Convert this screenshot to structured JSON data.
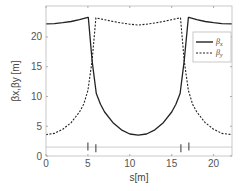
{
  "chart_data": {
    "type": "line",
    "title": "",
    "xlabel": "s[m]",
    "ylabel": "βx,βy [m]",
    "xlim": [
      0,
      22.2
    ],
    "ylim": [
      0,
      25.2
    ],
    "xticks": [
      0,
      5,
      10,
      15,
      20
    ],
    "yticks": [
      0,
      5,
      10,
      15,
      20
    ],
    "grid": false,
    "legend_position": "upper right",
    "series": [
      {
        "name": "βx",
        "style": "solid",
        "color": "#222222",
        "x": [
          0,
          1,
          2,
          3,
          4,
          5,
          5.05,
          5.5,
          6,
          6.5,
          7,
          8,
          9,
          10,
          11,
          12,
          13,
          14,
          15,
          15.5,
          16,
          16.5,
          17.0,
          17.05,
          18,
          19,
          20,
          21,
          22.2
        ],
        "y": [
          22.2,
          22.25,
          22.4,
          22.6,
          22.9,
          23.3,
          23.3,
          16.0,
          10.5,
          8.7,
          7.4,
          5.6,
          4.4,
          3.7,
          3.5,
          3.7,
          4.4,
          5.6,
          7.4,
          8.7,
          10.5,
          16.0,
          23.3,
          23.3,
          22.9,
          22.6,
          22.4,
          22.25,
          22.2
        ]
      },
      {
        "name": "βy",
        "style": "dashed",
        "color": "#222222",
        "x": [
          0,
          1,
          2,
          3,
          4,
          4.5,
          5,
          5.5,
          5.95,
          6,
          7,
          8,
          9,
          10,
          11,
          12,
          13,
          14,
          15,
          16,
          16.05,
          16.5,
          17,
          17.5,
          18,
          19,
          20,
          21,
          22.2
        ],
        "y": [
          3.6,
          3.8,
          4.5,
          5.6,
          7.4,
          8.7,
          11.0,
          16.0,
          23.2,
          23.2,
          22.9,
          22.6,
          22.35,
          22.15,
          22.0,
          22.15,
          22.35,
          22.6,
          22.9,
          23.2,
          23.2,
          16.0,
          11.0,
          8.7,
          7.4,
          5.6,
          4.5,
          3.8,
          3.6
        ]
      }
    ],
    "annotations": [
      {
        "type": "element-marker",
        "s": 5.0,
        "y": 1.6
      },
      {
        "type": "element-marker",
        "s": 5.95,
        "y": 1.3
      },
      {
        "type": "element-marker",
        "s": 16.1,
        "y": 1.3
      },
      {
        "type": "element-marker",
        "s": 17.05,
        "y": 1.6
      }
    ],
    "baseline": {
      "y": 1.5,
      "color": "#cccccc"
    }
  },
  "labels": {
    "xlabel": "s[m]",
    "ylabel": "βx,βy [m]",
    "legend_x": "β",
    "legend_x_sub": "x",
    "legend_y": "β",
    "legend_y_sub": "y"
  }
}
